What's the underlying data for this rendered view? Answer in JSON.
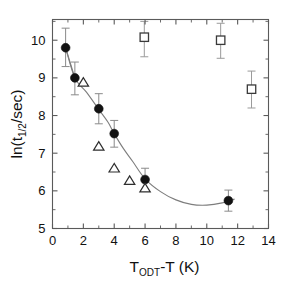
{
  "figure": {
    "background_color": "#ffffff",
    "frame_color": "#5a5a5a"
  },
  "chart_data": {
    "type": "scatter",
    "title": "",
    "xlabel": "T_ODT-T  (K)",
    "xlabel_parts": {
      "main_1": "T",
      "subscript": "ODT",
      "main_2": "-T  (K)"
    },
    "ylabel": "ln(t_1/2/sec)",
    "ylabel_parts": {
      "main_1": "ln(t",
      "subscript": "1/2",
      "main_2": "/sec)"
    },
    "xlim": [
      0,
      14
    ],
    "ylim": [
      5,
      10.55
    ],
    "xticks": [
      0,
      2,
      4,
      6,
      8,
      10,
      12,
      14
    ],
    "xticklabels": [
      "0",
      "2",
      "4",
      "6",
      "8",
      "10",
      "12",
      "14"
    ],
    "xminorticks": [
      1,
      3,
      5,
      7,
      9,
      11,
      13
    ],
    "yticks": [
      5,
      6,
      7,
      8,
      9,
      10
    ],
    "yticklabels": [
      "5",
      "6",
      "7",
      "8",
      "9",
      "10"
    ],
    "yminorticks": [
      5.5,
      6.5,
      7.5,
      8.5,
      9.5,
      10.5
    ],
    "grid": false,
    "legend": "none",
    "tick_direction": "in",
    "frame": "box",
    "series": [
      {
        "name": "filled-circles",
        "marker": "circle-filled",
        "color": "#121212",
        "has_errorbars": true,
        "points": [
          {
            "x": 0.85,
            "y": 9.8,
            "yerr_low": 0.5,
            "yerr_high": 0.52
          },
          {
            "x": 1.45,
            "y": 9.0,
            "yerr_low": 0.45,
            "yerr_high": 0.42
          },
          {
            "x": 3.0,
            "y": 8.18,
            "yerr_low": 0.4,
            "yerr_high": 0.4
          },
          {
            "x": 4.0,
            "y": 7.52,
            "yerr_low": 0.36,
            "yerr_high": 0.35
          },
          {
            "x": 6.0,
            "y": 6.3,
            "yerr_low": 0.3,
            "yerr_high": 0.3
          },
          {
            "x": 11.4,
            "y": 5.74,
            "yerr_low": 0.28,
            "yerr_high": 0.28
          }
        ]
      },
      {
        "name": "open-triangles",
        "marker": "triangle-open",
        "color": "#2e2e2e",
        "has_errorbars": false,
        "points": [
          {
            "x": 2.0,
            "y": 8.88
          },
          {
            "x": 3.0,
            "y": 7.18
          },
          {
            "x": 4.0,
            "y": 6.6
          },
          {
            "x": 5.0,
            "y": 6.27
          },
          {
            "x": 6.0,
            "y": 6.07
          }
        ]
      },
      {
        "name": "open-squares",
        "marker": "square-open",
        "color": "#3a3a3a",
        "has_errorbars": true,
        "points": [
          {
            "x": 5.95,
            "y": 10.08,
            "yerr_low": 0.52,
            "yerr_high": 0.42
          },
          {
            "x": 10.9,
            "y": 10.0,
            "yerr_low": 0.48,
            "yerr_high": 0.45
          },
          {
            "x": 12.9,
            "y": 8.7,
            "yerr_low": 0.5,
            "yerr_high": 0.48
          }
        ]
      }
    ],
    "fit_curve": {
      "name": "fitted-curve",
      "color": "#7d7d7d",
      "points": [
        {
          "x": 0.85,
          "y": 9.8
        },
        {
          "x": 1.45,
          "y": 9.0
        },
        {
          "x": 2.2,
          "y": 8.62
        },
        {
          "x": 3.0,
          "y": 8.16
        },
        {
          "x": 3.6,
          "y": 7.82
        },
        {
          "x": 4.0,
          "y": 7.52
        },
        {
          "x": 4.6,
          "y": 7.12
        },
        {
          "x": 5.2,
          "y": 6.78
        },
        {
          "x": 6.0,
          "y": 6.32
        },
        {
          "x": 7.0,
          "y": 5.98
        },
        {
          "x": 8.0,
          "y": 5.76
        },
        {
          "x": 9.0,
          "y": 5.64
        },
        {
          "x": 10.0,
          "y": 5.62
        },
        {
          "x": 11.0,
          "y": 5.68
        },
        {
          "x": 11.8,
          "y": 5.78
        }
      ]
    },
    "connector_line": {
      "name": "circle-connector",
      "color": "#7d7d7d",
      "points": [
        {
          "x": 0.85,
          "y": 9.8
        },
        {
          "x": 1.45,
          "y": 9.0
        }
      ]
    }
  }
}
